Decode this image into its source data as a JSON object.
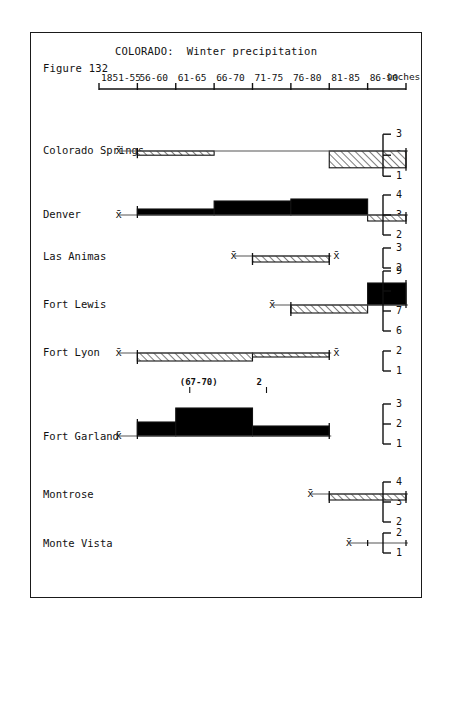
{
  "figure": {
    "number_label": "Figure 132",
    "title": "COLORADO:  Winter precipitation",
    "units_label": "inches"
  },
  "axis": {
    "periods": [
      "1851-55",
      "56-60",
      "61-65",
      "66-70",
      "71-75",
      "76-80",
      "81-85",
      "86-90"
    ],
    "tick_count": 9,
    "x_start_px": 68,
    "x_end_px": 375,
    "y_px": 56
  },
  "legend": {
    "mean_symbol": "x̄",
    "above_mean_fill": "#000000",
    "below_mean_fill": "hatched",
    "frame_color": "#1a1a1a"
  },
  "chart_data": {
    "type": "bar",
    "title": "COLORADO:  Winter precipitation",
    "xlabel": "",
    "ylabel": "inches",
    "grid": false,
    "legend_position": "none",
    "categories": [
      "1851-55",
      "56-60",
      "61-65",
      "66-70",
      "71-75",
      "76-80",
      "81-85",
      "86-90"
    ],
    "series": [
      {
        "name": "Colorado Springs",
        "mean": 2.2,
        "scale_ticks": [
          3,
          2,
          1
        ],
        "segments": [
          {
            "period": "56-60",
            "value": 2.0,
            "state": "below"
          },
          {
            "period": "61-65",
            "value": 2.0,
            "state": "below"
          },
          {
            "period": "81-85",
            "value": 1.4,
            "state": "below"
          },
          {
            "period": "86-90",
            "value": 1.4,
            "state": "below"
          }
        ]
      },
      {
        "name": "Denver",
        "mean": 3.0,
        "scale_ticks": [
          4,
          3,
          2
        ],
        "segments": [
          {
            "period": "56-60",
            "value": 3.3,
            "state": "above"
          },
          {
            "period": "61-65",
            "value": 3.3,
            "state": "above"
          },
          {
            "period": "66-70",
            "value": 3.7,
            "state": "above"
          },
          {
            "period": "71-75",
            "value": 3.7,
            "state": "above"
          },
          {
            "period": "76-80",
            "value": 3.8,
            "state": "above"
          },
          {
            "period": "81-85",
            "value": 3.8,
            "state": "above"
          },
          {
            "period": "86-90",
            "value": 2.7,
            "state": "below"
          }
        ]
      },
      {
        "name": "Las Animas",
        "mean": 2.6,
        "scale_ticks": [
          3,
          2
        ],
        "segments": [
          {
            "period": "71-75",
            "value": 2.3,
            "state": "below"
          },
          {
            "period": "76-80",
            "value": 2.3,
            "state": "below"
          }
        ]
      },
      {
        "name": "Fort Lewis",
        "mean": 7.3,
        "scale_ticks": [
          9,
          8,
          7,
          6
        ],
        "segments": [
          {
            "period": "76-80",
            "value": 6.9,
            "state": "below"
          },
          {
            "period": "81-85",
            "value": 6.9,
            "state": "below"
          },
          {
            "period": "86-90",
            "value": 8.4,
            "state": "above"
          }
        ]
      },
      {
        "name": "Fort Lyon",
        "mean": 1.9,
        "scale_ticks": [
          2,
          1
        ],
        "segments": [
          {
            "period": "56-60",
            "value": 1.5,
            "state": "below"
          },
          {
            "period": "61-65",
            "value": 1.5,
            "state": "below"
          },
          {
            "period": "66-70",
            "value": 1.5,
            "state": "below"
          },
          {
            "period": "71-75",
            "value": 1.7,
            "state": "below"
          },
          {
            "period": "76-80",
            "value": 1.7,
            "state": "below"
          }
        ],
        "annotations": [
          {
            "text": "(67-70)",
            "period": "61-65"
          },
          {
            "text": "2",
            "period": "71-75"
          }
        ]
      },
      {
        "name": "Fort Garland",
        "mean": 1.4,
        "scale_ticks": [
          3,
          2,
          1
        ],
        "segments": [
          {
            "period": "56-60",
            "value": 2.1,
            "state": "above"
          },
          {
            "period": "61-65",
            "value": 2.8,
            "state": "above"
          },
          {
            "period": "66-70",
            "value": 2.8,
            "state": "above"
          },
          {
            "period": "71-75",
            "value": 1.9,
            "state": "above"
          },
          {
            "period": "76-80",
            "value": 1.9,
            "state": "above"
          }
        ]
      },
      {
        "name": "Montrose",
        "mean": 3.4,
        "scale_ticks": [
          4,
          3,
          2
        ],
        "segments": [
          {
            "period": "81-85",
            "value": 3.1,
            "state": "below"
          },
          {
            "period": "86-90",
            "value": 3.1,
            "state": "below"
          }
        ]
      },
      {
        "name": "Monte Vista",
        "mean": 1.5,
        "scale_ticks": [
          2,
          1
        ],
        "segments": [
          {
            "period": "86-90",
            "value": 1.5,
            "state": "equal"
          }
        ]
      }
    ]
  }
}
